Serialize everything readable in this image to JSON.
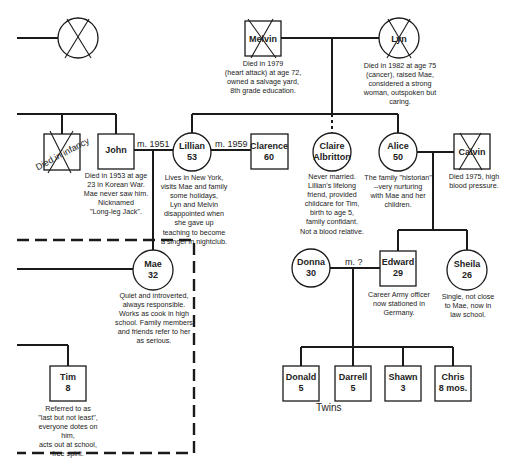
{
  "diagram": {
    "type": "genogram",
    "people": {
      "unknown_grandparent": {
        "name": "",
        "sex": "female",
        "deceased": true
      },
      "melvin": {
        "name": "Melvin",
        "sex": "male",
        "deceased": true,
        "note": "Died in 1979\n(heart attack) at age 72,\nowned a salvage yard,\n8th grade education."
      },
      "lyn": {
        "name": "Lyn",
        "sex": "female",
        "deceased": true,
        "note": "Died in 1982 at age 75\n(cancer), raised Mae,\nconsidered a strong\nwoman, outspoken but\ncaring."
      },
      "infant": {
        "name": "Died in infancy",
        "sex": "male",
        "deceased": true
      },
      "john": {
        "name": "John",
        "sex": "male",
        "note": "Died in 1953 at age\n23 in Korean War.\nMae never saw him.\nNicknamed\n\"Long-leg Jack\"."
      },
      "lillian": {
        "name": "Lillian",
        "age": "53",
        "sex": "female",
        "note": "Lives in New York,\nvisits Mae and family\nsome holidays,\nLyn and Melvin\ndisappointed when\nshe gave up\nteaching to become\na singer in nightclub."
      },
      "clarence": {
        "name": "Clarence",
        "age": "60",
        "sex": "male"
      },
      "claire": {
        "name_line1": "Claire",
        "name_line2": "Albritton",
        "sex": "female",
        "note": "Never married.\nLillian's lifelong\nfriend, provided\nchildcare for Tim,\nbirth to age 5,\nfamily confidant.\nNot a blood relative."
      },
      "alice": {
        "name": "Alice",
        "age": "50",
        "sex": "female",
        "note": "The family \"historian\"\n--very nurturing\nwith Mae and her\nchildren."
      },
      "calvin": {
        "name": "Calvin",
        "sex": "male",
        "deceased": true,
        "note": "Died 1975, high\nblood pressure."
      },
      "mae": {
        "name": "Mae",
        "age": "32",
        "sex": "female",
        "note": "Quiet and introverted,\nalways responsible.\nWorks as cook in high\nschool. Family members\nand friends refer to her\nas serious."
      },
      "tim": {
        "name": "Tim",
        "age": "8",
        "sex": "male",
        "note": "Referred to as\n\"last but not least\",\neveryone dotes on him,\nacts out at school,\nfree spirit."
      },
      "donna": {
        "name": "Donna",
        "age": "30",
        "sex": "female"
      },
      "edward": {
        "name": "Edward",
        "age": "29",
        "sex": "male",
        "note": "Career Army officer\nnow stationed in\nGermany."
      },
      "sheila": {
        "name": "Sheila",
        "age": "26",
        "sex": "female",
        "note": "Single, not close\nto Mae, now in\nlaw school."
      },
      "donald": {
        "name": "Donald",
        "age": "5",
        "sex": "male"
      },
      "darrell": {
        "name": "Darrell",
        "age": "5",
        "sex": "male"
      },
      "shawn": {
        "name": "Shawn",
        "age": "3",
        "sex": "male"
      },
      "chris": {
        "name": "Chris",
        "age": "8 mos.",
        "sex": "male"
      }
    },
    "relationships": {
      "john_lillian": "m. 1951",
      "lillian_clarence": "m. 1959",
      "donna_edward": "m. ?",
      "twins_label": "Twins"
    },
    "household_boundary": "dashed"
  }
}
